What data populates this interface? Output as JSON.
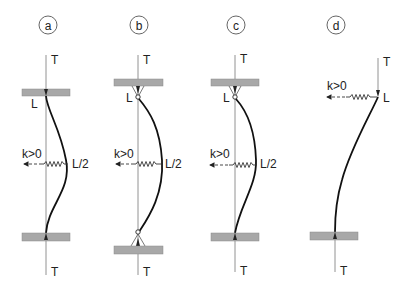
{
  "figure": {
    "panels": [
      {
        "id": "a",
        "label": "a",
        "top_tension": "T",
        "bottom_tension": "T",
        "top_node_label": "L",
        "spring_label": "k>0",
        "spring_position_label": "L/2",
        "top_support": "clamped",
        "bottom_support": "clamped"
      },
      {
        "id": "b",
        "label": "b",
        "top_tension": "T",
        "bottom_tension": "T",
        "top_node_label": "L",
        "spring_label": "k>0",
        "spring_position_label": "L/2",
        "top_support": "pinned",
        "bottom_support": "pinned"
      },
      {
        "id": "c",
        "label": "c",
        "top_tension": "T",
        "bottom_tension": "T",
        "top_node_label": "L",
        "spring_label": "k>0",
        "spring_position_label": "L/2",
        "top_support": "pinned",
        "bottom_support": "clamped"
      },
      {
        "id": "d",
        "label": "d",
        "top_tension": "T",
        "bottom_tension": "T",
        "top_node_label": "L",
        "spring_label": "k>0",
        "top_support": "free",
        "bottom_support": "clamped"
      }
    ]
  }
}
